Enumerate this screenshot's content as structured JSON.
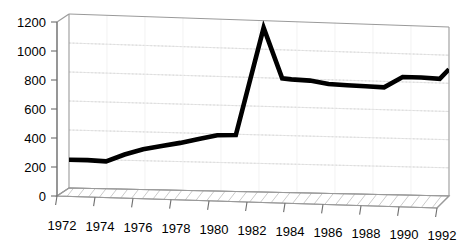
{
  "chart_data": {
    "type": "line",
    "title": "",
    "subtitle": "",
    "xlabel": "",
    "ylabel": "",
    "x": [
      1972,
      1973,
      1974,
      1975,
      1976,
      1977,
      1978,
      1979,
      1980,
      1981,
      1982.5,
      1983.5,
      1984,
      1985,
      1986,
      1987,
      1988,
      1989,
      1990,
      1991,
      1992,
      1992.5
    ],
    "values": [
      195,
      195,
      190,
      240,
      280,
      305,
      330,
      360,
      390,
      395,
      1150,
      800,
      795,
      790,
      770,
      765,
      762,
      758,
      835,
      835,
      830,
      900
    ],
    "series": [
      {
        "name": "series-1",
        "values": [
          195,
          195,
          190,
          240,
          280,
          305,
          330,
          360,
          390,
          395,
          1150,
          800,
          795,
          790,
          770,
          765,
          762,
          758,
          835,
          835,
          830,
          900
        ]
      }
    ],
    "xlim": [
      1972,
      1992.5
    ],
    "ylim": [
      0,
      1200
    ],
    "yticks": [
      0,
      200,
      400,
      600,
      800,
      1000,
      1200
    ],
    "ytick_labels": [
      "0",
      "200",
      "400",
      "600",
      "800",
      "1000",
      "1200"
    ],
    "xticks": [
      1972,
      1974,
      1976,
      1978,
      1980,
      1982,
      1984,
      1986,
      1988,
      1990,
      1992
    ],
    "xtick_labels": [
      "1972",
      "1974",
      "1976",
      "1978",
      "1980",
      "1982",
      "1984",
      "1986",
      "1988",
      "1990",
      "1992"
    ],
    "grid": true,
    "grid_style": "dotted",
    "legend": false,
    "legend_position": "none",
    "projection": "3d-perspective",
    "annotations": [],
    "colors": {
      "line": "#000000",
      "grid": "#cfcfcf",
      "frame": "#9a9a9a",
      "floor": "#ffffff",
      "floor_hatch": "#8a8a8a",
      "background": "#ffffff",
      "tick_text": "#000000"
    }
  }
}
